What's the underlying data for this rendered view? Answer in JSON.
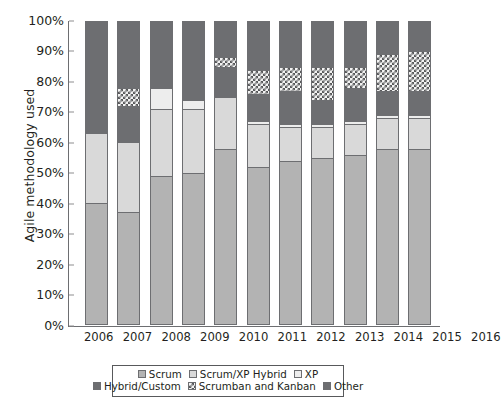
{
  "chart_data": {
    "type": "bar",
    "subtype": "stacked-bar-100",
    "title": "",
    "xlabel": "",
    "ylabel": "Agile methodology used",
    "ylim": [
      0,
      100
    ],
    "y_unit": "%",
    "grid": false,
    "legend_position": "bottom",
    "categories": [
      "2006",
      "2007",
      "2008",
      "2009",
      "2010",
      "2011",
      "2012",
      "2013",
      "2014",
      "2015",
      "2016"
    ],
    "y_ticks": [
      "0%",
      "10%",
      "20%",
      "30%",
      "40%",
      "50%",
      "60%",
      "70%",
      "80%",
      "90%",
      "100%"
    ],
    "series": [
      {
        "name": "Scrum",
        "color": "#b3b3b3",
        "values": [
          40,
          37,
          49,
          50,
          58,
          52,
          54,
          55,
          56,
          58,
          58
        ]
      },
      {
        "name": "Scrum/XP Hybrid",
        "color": "#d9d9d9",
        "values": [
          23,
          23,
          22,
          21,
          17,
          14,
          11,
          10,
          10,
          10,
          10
        ]
      },
      {
        "name": "XP",
        "color": "#ededed",
        "values": [
          0,
          0,
          7,
          3,
          0,
          1,
          1,
          1,
          1,
          1,
          1
        ]
      },
      {
        "name": "Hybrid/Custom",
        "color": "#6d6e71",
        "values": [
          14,
          12,
          6,
          11,
          10,
          9,
          11,
          8,
          11,
          8,
          8
        ]
      },
      {
        "name": "Scrumban and Kanban",
        "color": "#58595b",
        "pattern": "checkered",
        "values": [
          0,
          6,
          0,
          0,
          3,
          8,
          8,
          11,
          7,
          12,
          13
        ]
      },
      {
        "name": "Other",
        "color": "#6d6e71",
        "values": [
          23,
          22,
          16,
          15,
          12,
          16,
          15,
          15,
          15,
          11,
          10
        ]
      }
    ]
  },
  "axes": {
    "y_title": "Agile methodology used",
    "y_ticks": [
      {
        "label": "100%",
        "value": 100
      },
      {
        "label": "90%",
        "value": 90
      },
      {
        "label": "80%",
        "value": 80
      },
      {
        "label": "70%",
        "value": 70
      },
      {
        "label": "60%",
        "value": 60
      },
      {
        "label": "50%",
        "value": 50
      },
      {
        "label": "40%",
        "value": 40
      },
      {
        "label": "30%",
        "value": 30
      },
      {
        "label": "20%",
        "value": 20
      },
      {
        "label": "10%",
        "value": 10
      },
      {
        "label": "0%",
        "value": 0
      }
    ],
    "x_ticks": [
      "2006",
      "2007",
      "2008",
      "2009",
      "2010",
      "2011",
      "2012",
      "2013",
      "2014",
      "2015",
      "2016"
    ]
  },
  "legend": {
    "rows": [
      [
        {
          "label": "Scrum",
          "swatch": "swatch-scrum"
        },
        {
          "label": "Scrum/XP Hybrid",
          "swatch": "swatch-scrumxp"
        },
        {
          "label": "XP",
          "swatch": "swatch-xp"
        }
      ],
      [
        {
          "label": "Hybrid/Custom",
          "swatch": "swatch-hybrid"
        },
        {
          "label": "Scrumban and Kanban",
          "swatch": "swatch-scrumban"
        },
        {
          "label": "Other",
          "swatch": "swatch-other"
        }
      ]
    ]
  }
}
